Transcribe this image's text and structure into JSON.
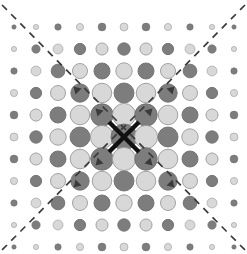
{
  "figure": {
    "title": "Symmetric dot lattice with diagonal mirror lines",
    "type": "diagram",
    "background_color": "#ffffff",
    "width": 247,
    "height": 254
  },
  "lattice": {
    "rows": 11,
    "cols": 11,
    "col_spacing": 22.0,
    "row_spacing": 22.0,
    "origin_x": 14.0,
    "origin_y": 27.0,
    "center_x": 124.0,
    "center_y": 137.0,
    "parity_rule": "checkerboard: (row+col) even = dark fill, odd = light fill",
    "size_rule": "radius tapers linearly with Chebyshev-like distance from lattice centre",
    "radii_by_ring": [
      13.0,
      11.6,
      10.0,
      8.2,
      6.2,
      4.0,
      2.2
    ],
    "colors": {
      "dark_fill": "#7d7d7d",
      "dark_stroke": "#6e6e6e",
      "light_fill": "#d8d8d8",
      "light_stroke": "#9a9a9a",
      "line_color": "#3b3b3b",
      "center_cross_color": "#111111"
    }
  },
  "annotations": {
    "diagonal_lines": [
      {
        "name": "mirror-line-nwse",
        "from_x": 2,
        "from_y": 5,
        "to_x": 245,
        "to_y": 250,
        "style": "dashed"
      },
      {
        "name": "mirror-line-nesw",
        "from_x": 245,
        "from_y": 5,
        "to_x": 2,
        "to_y": 250,
        "style": "dashed"
      }
    ],
    "center_cross": {
      "name": "center-cross-marker",
      "x": 124,
      "y": 137,
      "arm_length": 15,
      "stroke_width": 4.5
    },
    "arrow_markers": [
      {
        "x": 102,
        "y": 115,
        "dir": "nw"
      },
      {
        "x": 146,
        "y": 115,
        "dir": "ne"
      },
      {
        "x": 102,
        "y": 159,
        "dir": "sw"
      },
      {
        "x": 146,
        "y": 159,
        "dir": "se"
      },
      {
        "x": 80,
        "y": 93,
        "dir": "nw"
      },
      {
        "x": 168,
        "y": 93,
        "dir": "ne"
      },
      {
        "x": 80,
        "y": 181,
        "dir": "sw"
      },
      {
        "x": 168,
        "y": 181,
        "dir": "se"
      }
    ]
  },
  "chart_data": {
    "type": "scatter",
    "title": "Symmetric dot lattice with diagonal mirror lines",
    "xlabel": "",
    "ylabel": "",
    "grid": false,
    "legend": null,
    "xlim": [
      -5,
      5
    ],
    "ylim": [
      -5,
      5
    ],
    "x": [
      -5,
      -4,
      -3,
      -2,
      -1,
      0,
      1,
      2,
      3,
      4,
      5
    ],
    "y": [
      -5,
      -4,
      -3,
      -2,
      -1,
      0,
      1,
      2,
      3,
      4,
      5
    ],
    "marker_size_by_radius": {
      "0": 13.0,
      "1": 11.6,
      "2": 10.0,
      "3": 8.2,
      "4": 6.2,
      "5": 4.0
    },
    "series": [
      {
        "name": "dark-dots",
        "color": "#7d7d7d",
        "description": "cells where (row+col) is even"
      },
      {
        "name": "light-dots",
        "color": "#d8d8d8",
        "description": "cells where (row+col) is odd"
      }
    ]
  }
}
